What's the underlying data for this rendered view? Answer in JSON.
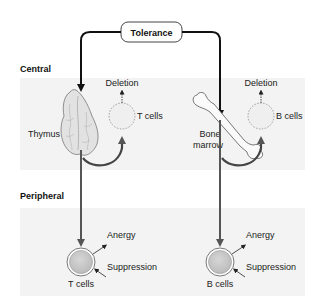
{
  "title_box": {
    "label": "Tolerance"
  },
  "sections": {
    "central": {
      "label": "Central"
    },
    "peripheral": {
      "label": "Peripheral"
    }
  },
  "central": {
    "left": {
      "organ_label": "Thymus",
      "cell_label": "T cells",
      "fate_label": "Deletion",
      "organ_icon": "thymus-icon"
    },
    "right": {
      "organ_label_line1": "Bone",
      "organ_label_line2": "marrow",
      "cell_label": "B cells",
      "fate_label": "Deletion",
      "organ_icon": "bone-icon"
    }
  },
  "peripheral": {
    "left": {
      "cell_label": "T cells",
      "mechanisms": [
        "Anergy",
        "Suppression"
      ]
    },
    "right": {
      "cell_label": "B cells",
      "mechanisms": [
        "Anergy",
        "Suppression"
      ]
    }
  },
  "colors": {
    "band": "#f3f3f3",
    "arrow_dark": "#111111",
    "arrow_grey": "#555555",
    "cell_fill": "#c8c8c8",
    "organ_fill": "#e4e4e4"
  }
}
